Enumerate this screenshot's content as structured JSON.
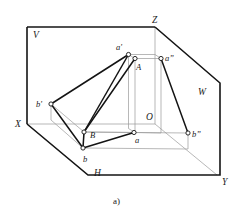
{
  "figure": {
    "caption": "a)",
    "caption_pos": {
      "x": 113,
      "y": 196
    },
    "stroke_heavy": "#141414",
    "stroke_light": "#8d8d8d",
    "stroke_medium": "#2b2b2b",
    "marker_fill": "#ffffff",
    "background": "#ffffff",
    "planes": [
      {
        "id": "V",
        "label": "V",
        "x": 33,
        "y": 31
      },
      {
        "id": "W",
        "label": "W",
        "x": 198,
        "y": 88
      },
      {
        "id": "H",
        "label": "H",
        "x": 94,
        "y": 169
      }
    ],
    "axes": [
      {
        "id": "X",
        "label": "X",
        "x": 15,
        "y": 120
      },
      {
        "id": "Y",
        "label": "Y",
        "x": 222,
        "y": 178
      },
      {
        "id": "Z",
        "label": "Z",
        "x": 152,
        "y": 16
      },
      {
        "id": "O",
        "label": "O",
        "x": 146,
        "y": 113
      }
    ],
    "points": [
      {
        "id": "a-prime",
        "label": "a'",
        "x": 128.5,
        "y": 54.5,
        "lx": 116,
        "ly": 43
      },
      {
        "id": "A",
        "label": "A",
        "x": 135,
        "y": 58.5,
        "lx": 136,
        "ly": 63
      },
      {
        "id": "a-dprime",
        "label": "a”",
        "x": 161,
        "y": 58.5,
        "lx": 165,
        "ly": 54
      },
      {
        "id": "a",
        "label": "a",
        "x": 134,
        "y": 132.5,
        "lx": 135,
        "ly": 136
      },
      {
        "id": "b-prime",
        "label": "b'",
        "x": 51,
        "y": 104,
        "lx": 36,
        "ly": 100
      },
      {
        "id": "B",
        "label": "B",
        "x": 84,
        "y": 132,
        "lx": 90,
        "ly": 131
      },
      {
        "id": "b-dprime",
        "label": "b”",
        "x": 188,
        "y": 133,
        "lx": 192,
        "ly": 130
      },
      {
        "id": "b",
        "label": "b",
        "x": 83,
        "y": 148,
        "lx": 83,
        "ly": 155
      }
    ],
    "outline": {
      "name": "projection-planes-outline",
      "v_plane": "M27,27 L155,27 L155,124 L27,124 Z",
      "h_plane": "M27,124 L88,175 L217,175 L155,124 Z",
      "w_plane": "M155,27 L220,83 L220,175 L155,124 Z"
    },
    "segments": {
      "AB_space": {
        "from": "A",
        "to": "B"
      },
      "ab_horizontal": {
        "from": "a",
        "to": "b"
      },
      "ab_vertical": {
        "from": "a-prime",
        "to": "b-prime"
      },
      "ab_profile": {
        "from": "a-dprime",
        "to": "b-dprime"
      }
    }
  }
}
